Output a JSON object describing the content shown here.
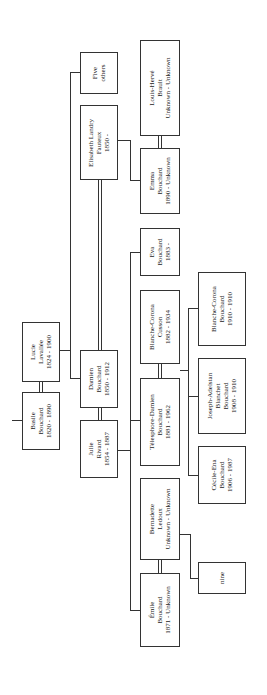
{
  "tree": {
    "people": {
      "basile": {
        "line1": "Basile",
        "line2": "Bouchard",
        "line3": "1820 - 1890"
      },
      "lucie": {
        "line1": "Lucie",
        "line2": "Lavallée",
        "line3": "1824 - 1900"
      },
      "damien": {
        "line1": "Damien",
        "line2": "Bouchard",
        "line3": "1850 - 1912"
      },
      "julie": {
        "line1": "Julie",
        "line2": "Rivard",
        "line3": "1854 - 1887"
      },
      "elisabeth": {
        "line1": "Elisabeth Landry",
        "line2": "Fauteux",
        "line3": "1850 -"
      },
      "five_others": {
        "line1": "Five",
        "line2": "others"
      },
      "louis_herve": {
        "line1": "Louis-Hervé",
        "line2": "Brault",
        "line3": "Unknown - Unknown"
      },
      "emma": {
        "line1": "Emma",
        "line2": "Bouchard",
        "line3": "1890 - Unknown"
      },
      "eva": {
        "line1": "Eva",
        "line2": "Bouchard",
        "line3": "1883 -"
      },
      "blanche_cusson": {
        "line1": "Blanche-Corona",
        "line2": "Cusson",
        "line3": "1882 - 1934"
      },
      "telesphore": {
        "line1": "Télesphore-Damien",
        "line2": "Bouchard",
        "line3": "1881 - 1962"
      },
      "bernadette": {
        "line1": "Bernadette",
        "line2": "Ledoux",
        "line3": "Unknown - Unknown"
      },
      "emile": {
        "line1": "Émile",
        "line2": "Bouchard",
        "line3": "1871 - Unknown"
      },
      "blanche_bouchard": {
        "line1": "Blanche-Corona",
        "line2": "Bouchard",
        "line3": "1910 - 1910"
      },
      "joseph": {
        "line1": "Joseph-Adelstan",
        "line2": "Blanchet",
        "line3": "Bouchard",
        "line4": "1908 - 1910"
      },
      "cecile": {
        "line1": "Cécile-Ena",
        "line2": "Bouchard",
        "line3": "1906 - 1987"
      },
      "nine": {
        "line1": "nine"
      }
    }
  }
}
